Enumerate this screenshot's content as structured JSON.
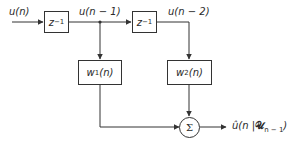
{
  "diagram": {
    "title": "",
    "type": "block-diagram",
    "nodes": {
      "input": {
        "label": "u(n)"
      },
      "delay1": {
        "label": "z",
        "exp": "−1"
      },
      "tap1": {
        "label": "u(n − 1)"
      },
      "delay2": {
        "label": "z",
        "exp": "−1"
      },
      "tap2": {
        "label": "u(n − 2)"
      },
      "weight1": {
        "var": "w",
        "sub": "1",
        "arg": "(n)"
      },
      "weight2": {
        "var": "w",
        "sub": "2",
        "arg": "(n)"
      },
      "summer": {
        "symbol": "Σ"
      },
      "output": {
        "hat": "û",
        "arg": "(n |",
        "script": "𝒰",
        "sub": "n − 1",
        "close": ")"
      }
    },
    "edges": [
      {
        "from": "input",
        "to": "delay1"
      },
      {
        "from": "delay1",
        "to": "delay2",
        "label": "u(n − 1)"
      },
      {
        "from": "delay1",
        "to": "weight1"
      },
      {
        "from": "delay2",
        "to": "weight2",
        "label": "u(n − 2)"
      },
      {
        "from": "weight1",
        "to": "summer"
      },
      {
        "from": "weight2",
        "to": "summer"
      },
      {
        "from": "summer",
        "to": "output"
      }
    ],
    "colors": {
      "stroke": "#333333",
      "text": "#2a2a2a",
      "background": "#ffffff"
    }
  }
}
